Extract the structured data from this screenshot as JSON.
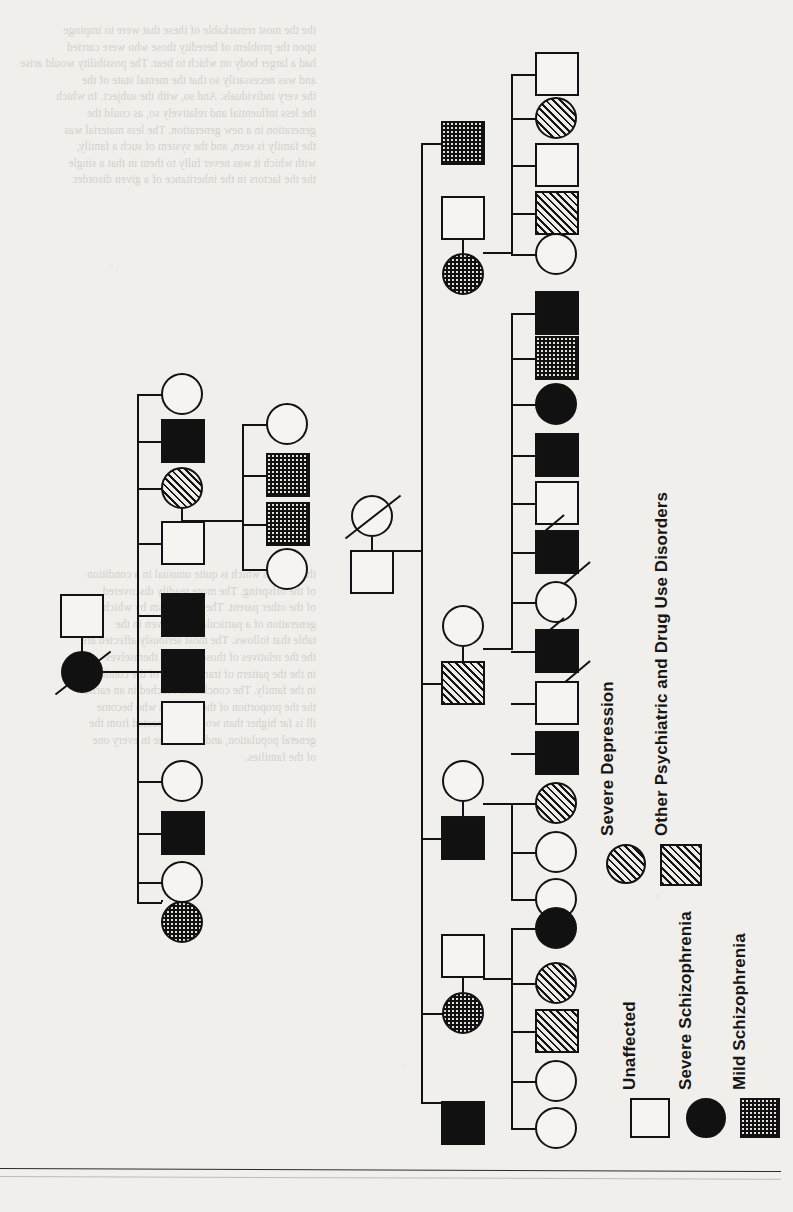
{
  "figure": {
    "kind": "pedigree-chart",
    "orientation": "rotated-90-ccw",
    "page_background": "#f1efeb",
    "ink_color": "#121212"
  },
  "legend": {
    "title": "",
    "orientation": "vertical-rotated",
    "items": [
      {
        "id": "unaffected",
        "label": "Unaffected",
        "shape": "square",
        "fill": "white",
        "symbol_color": "#f6f4f0"
      },
      {
        "id": "severe_schiz",
        "label": "Severe Schizophrenia",
        "shape": "circle",
        "fill": "solid",
        "symbol_color": "#111111"
      },
      {
        "id": "mild_schiz",
        "label": "Mild Schizophrenia",
        "shape": "square",
        "fill": "stipple",
        "symbol_color": "#111111"
      },
      {
        "id": "severe_depression",
        "label": "Severe Depression",
        "shape": "circle",
        "fill": "hatch",
        "symbol_color": "#141414"
      },
      {
        "id": "other_psych",
        "label": "Other Psychiatric and Drug Use Disorders",
        "shape": "square",
        "fill": "hatch",
        "symbol_color": "#141414"
      }
    ]
  },
  "pedigree": {
    "note": "Squares = male, circles = female. Slash = deceased.",
    "families": [
      {
        "id": "family-left",
        "parents": [
          {
            "sex": "male",
            "status": "unaffected",
            "deceased": false
          },
          {
            "sex": "female",
            "status": "severe_schiz",
            "deceased": true
          }
        ],
        "children": [
          {
            "sex": "female",
            "status": "unaffected"
          },
          {
            "sex": "male",
            "status": "severe_schiz"
          },
          {
            "sex": "female",
            "status": "severe_depression"
          },
          {
            "sex": "male",
            "status": "unaffected"
          },
          {
            "sex": "male",
            "status": "severe_schiz"
          },
          {
            "sex": "male",
            "status": "severe_schiz"
          },
          {
            "sex": "male",
            "status": "unaffected"
          },
          {
            "sex": "female",
            "status": "unaffected"
          },
          {
            "sex": "male",
            "status": "severe_schiz"
          },
          {
            "sex": "female",
            "status": "unaffected"
          },
          {
            "sex": "female",
            "status": "mild_schiz"
          }
        ]
      },
      {
        "id": "family-left-sub",
        "parents": [
          {
            "sex": "female",
            "status": "severe_depression",
            "deceased": false
          },
          {
            "sex": "male",
            "status": "unaffected",
            "deceased": false
          }
        ],
        "children": [
          {
            "sex": "female",
            "status": "unaffected"
          },
          {
            "sex": "male",
            "status": "mild_schiz"
          },
          {
            "sex": "male",
            "status": "mild_schiz"
          },
          {
            "sex": "female",
            "status": "unaffected"
          }
        ]
      },
      {
        "id": "family-right-founders",
        "parents": [
          {
            "sex": "female",
            "status": "unaffected",
            "deceased": true
          },
          {
            "sex": "male",
            "status": "unaffected",
            "deceased": false
          }
        ],
        "children": []
      },
      {
        "id": "sib-A",
        "parents": [
          {
            "sex": "male",
            "status": "mild_schiz",
            "deceased": false
          },
          {
            "sex": "male",
            "status": "unaffected",
            "deceased": false
          },
          {
            "sex": "female",
            "status": "mild_schiz",
            "deceased": false
          }
        ],
        "children": [
          {
            "sex": "male",
            "status": "unaffected"
          },
          {
            "sex": "female",
            "status": "severe_depression"
          },
          {
            "sex": "male",
            "status": "unaffected"
          },
          {
            "sex": "male",
            "status": "other_psych"
          },
          {
            "sex": "female",
            "status": "unaffected"
          }
        ]
      },
      {
        "id": "sib-B",
        "parents": [
          {
            "sex": "female",
            "status": "unaffected",
            "deceased": false
          },
          {
            "sex": "male",
            "status": "severe_schiz",
            "deceased": false
          }
        ],
        "children": [
          {
            "sex": "male",
            "status": "severe_schiz"
          },
          {
            "sex": "male",
            "status": "mild_schiz"
          },
          {
            "sex": "female",
            "status": "severe_schiz"
          },
          {
            "sex": "male",
            "status": "severe_schiz"
          },
          {
            "sex": "male",
            "status": "unaffected",
            "deceased": true
          },
          {
            "sex": "male",
            "status": "severe_schiz",
            "deceased": true
          },
          {
            "sex": "female",
            "status": "unaffected"
          },
          {
            "sex": "male",
            "status": "severe_schiz",
            "deceased": true
          },
          {
            "sex": "male",
            "status": "unaffected"
          },
          {
            "sex": "male",
            "status": "severe_schiz"
          }
        ]
      },
      {
        "id": "sib-C",
        "parents": [
          {
            "sex": "female",
            "status": "unaffected",
            "deceased": false
          },
          {
            "sex": "male",
            "status": "other_psych",
            "deceased": false
          }
        ],
        "children": [
          {
            "sex": "female",
            "status": "severe_depression"
          },
          {
            "sex": "female",
            "status": "unaffected"
          },
          {
            "sex": "female",
            "status": "unaffected"
          }
        ]
      },
      {
        "id": "sib-D",
        "parents": [
          {
            "sex": "female",
            "status": "unaffected",
            "deceased": false
          },
          {
            "sex": "male",
            "status": "severe_schiz",
            "deceased": false
          }
        ],
        "children": [
          {
            "sex": "female",
            "status": "severe_schiz"
          },
          {
            "sex": "female",
            "status": "severe_depression"
          },
          {
            "sex": "male",
            "status": "other_psych"
          },
          {
            "sex": "female",
            "status": "unaffected"
          },
          {
            "sex": "female",
            "status": "unaffected"
          }
        ]
      },
      {
        "id": "sib-E",
        "parents": [
          {
            "sex": "male",
            "status": "unaffected",
            "deceased": false
          },
          {
            "sex": "female",
            "status": "mild_schiz",
            "deceased": false
          }
        ],
        "children": [
          {
            "sex": "male",
            "status": "severe_schiz"
          }
        ]
      }
    ]
  },
  "ghost_text": {
    "top": "the the most remarkable of these that were to impinge\nupon the problem of heredity those who were carried\nhad a larger body on which to bear. The possibility would arise\nand was necessarily so that the mental state of the\nthe very individuals. And so, with the subject. In which\nthe less influential and relatively so, as could the\ngeneration in a new generation. The less material was\nthe family is seen, and the system of such a family,\nwith which it was never fully to them in that a single\nthe the factors in the inheritance of a given disorder.\n",
    "bottom": "these terms which is quite unusual in a condition\nof the offspring. The more readily discovered\nof the other parent. The mechanism by which the\ngeneration of a particular sort, given in the\ntable that follows. The most seriously affected are\nthe the relatives of those who are themselves\nin the the pattern of transmission of the condition\nin the family. The conclusion reached in an earlier\nthe the proportion of the relatives who become\nill is far higher than would be expected from the\ngeneral population, and this is true in every one\nof the families."
  }
}
